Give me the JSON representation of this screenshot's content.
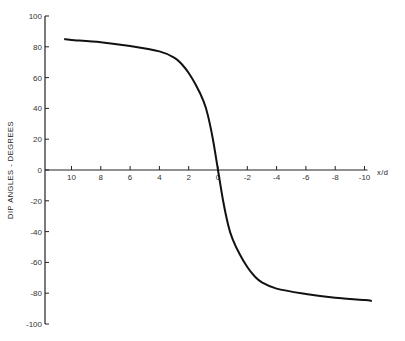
{
  "chart_data": {
    "type": "line",
    "title": "",
    "xlabel": "x/d",
    "ylabel": "DIP ANGLES - DEGREES",
    "xlim": [
      10.5,
      -10.5
    ],
    "ylim": [
      -100,
      100
    ],
    "x_reversed": true,
    "grid": false,
    "legend": null,
    "x_ticks": [
      10,
      8,
      6,
      4,
      2,
      0,
      -2,
      -4,
      -6,
      -8,
      -10
    ],
    "x_tick_labels": [
      "10",
      "8",
      "6",
      "4",
      "2",
      "0",
      "-2",
      "-4",
      "-6",
      "-8",
      "-10"
    ],
    "y_ticks": [
      100,
      80,
      60,
      40,
      20,
      0,
      -20,
      -40,
      -60,
      -80,
      -100
    ],
    "y_tick_labels": [
      "100",
      "80",
      "60",
      "40",
      "20",
      "0",
      "-20",
      "-40",
      "-60",
      "-80",
      "-100"
    ],
    "series": [
      {
        "name": "dip angle",
        "color": "#111111",
        "x": [
          10.5,
          10,
          8,
          6,
          4,
          3,
          2.5,
          2,
          1.5,
          1,
          0.7,
          0.35,
          0,
          -0.35,
          -0.7,
          -1,
          -1.5,
          -2,
          -2.5,
          -3,
          -4,
          -6,
          -8,
          -10,
          -10.5
        ],
        "y": [
          85,
          84.5,
          83,
          80.5,
          77,
          73,
          69,
          63,
          55,
          45,
          36,
          20,
          0,
          -20,
          -36,
          -45,
          -55,
          -63,
          -69,
          -73,
          -77,
          -80.5,
          -83,
          -84.5,
          -85
        ]
      }
    ]
  },
  "labels": {
    "ylabel": "DIP ANGLES - DEGREES",
    "xlabel": "x/d"
  }
}
